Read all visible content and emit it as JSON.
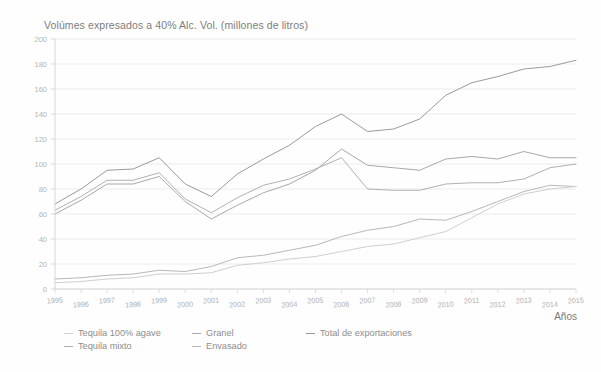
{
  "chart_data": {
    "type": "line",
    "title": "Volúmes expresados a 40% Alc. Vol. (millones de litros)",
    "xlabel": "Años",
    "ylabel": "",
    "grid": true,
    "legend_position": "bottom-left",
    "xlim": [
      1995,
      2015
    ],
    "ylim": [
      0,
      200
    ],
    "yticks": [
      0,
      20,
      40,
      60,
      80,
      100,
      120,
      140,
      160,
      180,
      200
    ],
    "categories": [
      "1995",
      "1996",
      "1997",
      "1998",
      "1999",
      "2000",
      "2001",
      "2002",
      "2003",
      "2004",
      "2005",
      "2006",
      "2007",
      "2008",
      "2009",
      "2010",
      "2011",
      "2012",
      "2013",
      "2014",
      "2015"
    ],
    "series": [
      {
        "name": "Total de exportaciones",
        "color": "#9a9a9a",
        "values": [
          68,
          80,
          95,
          96,
          105,
          84,
          74,
          92,
          104,
          115,
          130,
          140,
          126,
          128,
          136,
          155,
          165,
          170,
          176,
          178,
          183
        ]
      },
      {
        "name": "Granel",
        "color": "#a8a8a8",
        "values": [
          60,
          71,
          84,
          84,
          90,
          70,
          56,
          67,
          77,
          84,
          95,
          112,
          99,
          97,
          95,
          104,
          106,
          104,
          110,
          105,
          105
        ]
      },
      {
        "name": "Tequila mixto",
        "color": "#b0b0b0",
        "values": [
          63,
          74,
          87,
          87,
          93,
          72,
          61,
          73,
          83,
          88,
          96,
          105,
          80,
          79,
          79,
          84,
          85,
          85,
          88,
          97,
          100
        ]
      },
      {
        "name": "Envasado",
        "color": "#b8b8b8",
        "values": [
          8,
          9,
          11,
          12,
          15,
          14,
          18,
          25,
          27,
          31,
          35,
          42,
          47,
          50,
          56,
          55,
          62,
          70,
          78,
          83,
          82
        ]
      },
      {
        "name": "Tequila 100% agave",
        "color": "#cfcfcf",
        "values": [
          5,
          6,
          8,
          9,
          12,
          12,
          13,
          19,
          21,
          24,
          26,
          30,
          34,
          36,
          41,
          46,
          57,
          68,
          76,
          80,
          82
        ]
      }
    ]
  },
  "axis": {
    "x_title": "Años"
  },
  "legend": {
    "columns": [
      {
        "items": [
          {
            "label": "Tequila 100% agave",
            "color": "#cfcfcf"
          },
          {
            "label": "Tequila mixto",
            "color": "#b0b0b0"
          }
        ]
      },
      {
        "items": [
          {
            "label": "Granel",
            "color": "#a8a8a8"
          },
          {
            "label": "Envasado",
            "color": "#b8b8b8"
          }
        ]
      },
      {
        "items": [
          {
            "label": "Total de exportaciones",
            "color": "#9a9a9a"
          }
        ]
      }
    ]
  }
}
